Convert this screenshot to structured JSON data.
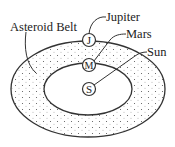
{
  "diagram": {
    "labels": {
      "jupiter": "Jupiter",
      "mars": "Mars",
      "sun": "Sun",
      "asteroid_belt": "Asteroid Belt"
    },
    "bodies": {
      "jupiter": "J",
      "mars": "M",
      "sun": "S"
    },
    "colors": {
      "stroke": "#333333",
      "dots": "#555555",
      "background": "#ffffff"
    }
  }
}
